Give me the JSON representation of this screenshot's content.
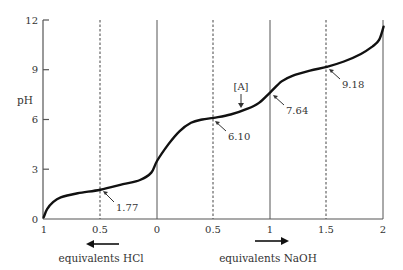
{
  "chart_data": {
    "type": "line",
    "title": "",
    "ylabel": "pH",
    "xlabel_left": "equivalents HCl",
    "xlabel_right": "equivalents NaOH",
    "ylim": [
      0,
      12
    ],
    "yticks": [
      0,
      3,
      6,
      9,
      12
    ],
    "ytick_labels": [
      "0",
      "3",
      "6",
      "9",
      "12"
    ],
    "x_unified_range": [
      -1,
      2
    ],
    "xticks": [
      -1,
      -0.5,
      0,
      0.5,
      1,
      1.5,
      2
    ],
    "xtick_labels": [
      "1",
      "0.5",
      "0",
      "0.5",
      "1",
      "1.5",
      "2"
    ],
    "grid": false,
    "solid_guides_x": [
      0,
      1,
      2
    ],
    "dashed_guides_x": [
      -0.5,
      0.5,
      1.5
    ],
    "series": [
      {
        "name": "titration curve",
        "x": [
          -1,
          -0.97,
          -0.92,
          -0.85,
          -0.7,
          -0.5,
          -0.3,
          -0.15,
          -0.05,
          0,
          0.1,
          0.2,
          0.3,
          0.4,
          0.5,
          0.65,
          0.8,
          0.9,
          1,
          1.1,
          1.2,
          1.35,
          1.5,
          1.65,
          1.8,
          1.9,
          1.96,
          2
        ],
        "y": [
          0.1,
          0.6,
          1.0,
          1.3,
          1.55,
          1.77,
          2.1,
          2.35,
          2.8,
          3.5,
          4.5,
          5.3,
          5.8,
          6.0,
          6.1,
          6.3,
          6.65,
          7.0,
          7.64,
          8.3,
          8.65,
          8.95,
          9.18,
          9.5,
          9.95,
          10.4,
          10.8,
          11.6
        ]
      }
    ],
    "annotations": [
      {
        "text": "1.77",
        "x": -0.5,
        "y": 1.77
      },
      {
        "text": "6.10",
        "x": 0.5,
        "y": 6.1
      },
      {
        "text": "7.64",
        "x": 1.0,
        "y": 7.64
      },
      {
        "text": "9.18",
        "x": 1.5,
        "y": 9.18
      },
      {
        "text": "[A]",
        "x": 0.77,
        "y": 6.6,
        "kind": "down-arrow-marker"
      }
    ],
    "direction_arrows": [
      {
        "label": "equivalents HCl",
        "direction": "left"
      },
      {
        "label": "equivalents NaOH",
        "direction": "right"
      }
    ]
  },
  "labels": {
    "ylabel": "pH",
    "hcl": "equivalents HCl",
    "naoh": "equivalents NaOH",
    "marker_a": "[A]",
    "ann_177": "1.77",
    "ann_610": "6.10",
    "ann_764": "7.64",
    "ann_918": "9.18",
    "y0": "0",
    "y3": "3",
    "y6": "6",
    "y9": "9",
    "y12": "12",
    "xHcl1": "1",
    "xHcl05": "0.5",
    "x0": "0",
    "xNa05": "0.5",
    "xNa1": "1",
    "xNa15": "1.5",
    "xNa2": "2"
  }
}
